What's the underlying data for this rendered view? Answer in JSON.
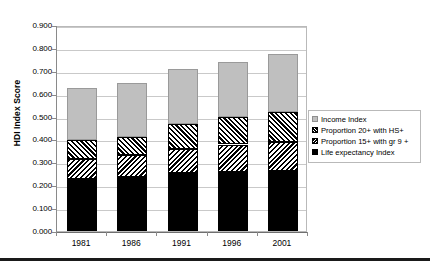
{
  "chart_data": {
    "type": "bar",
    "subtype": "stacked-bar",
    "title": "",
    "xlabel": "",
    "ylabel": "HDI Index Score",
    "ylim": [
      0.0,
      0.9
    ],
    "ytick_labels": [
      "0.900",
      "0.800",
      "0.700",
      "0.600",
      "0.500",
      "0.400",
      "0.300",
      "0.200",
      "0.100",
      "0.000"
    ],
    "ytick_values": [
      0.9,
      0.8,
      0.7,
      0.6,
      0.5,
      0.4,
      0.3,
      0.2,
      0.1,
      0.0
    ],
    "grid": true,
    "grid_axis": "y",
    "legend_position": "right",
    "categories": [
      "1981",
      "1986",
      "1991",
      "1996",
      "2001"
    ],
    "series": [
      {
        "name": "Life expectancy Index",
        "swatch": "solid-black",
        "color": "#000000",
        "values": [
          0.228,
          0.237,
          0.253,
          0.258,
          0.262
        ]
      },
      {
        "name": "Proportion 15+ with gr 9 +",
        "swatch": "diagonal-hatch-left",
        "color": "#000000",
        "values": [
          0.087,
          0.093,
          0.107,
          0.12,
          0.128
        ]
      },
      {
        "name": "Proportion 20+ with HS+",
        "swatch": "diagonal-hatch-right",
        "color": "#000000",
        "values": [
          0.083,
          0.082,
          0.106,
          0.122,
          0.13
        ]
      },
      {
        "name": "Income Index",
        "swatch": "solid-gray",
        "color": "#bfbfbf",
        "values": [
          0.229,
          0.233,
          0.241,
          0.24,
          0.254
        ]
      }
    ],
    "totals": [
      0.627,
      0.645,
      0.707,
      0.74,
      0.772
    ]
  },
  "legend": {
    "items": [
      {
        "label": "Income Index",
        "swatch": "income-swatch"
      },
      {
        "label": "Proportion 20+ with HS+",
        "swatch": "hs-swatch"
      },
      {
        "label": "Proportion 15+ with gr 9 +",
        "swatch": "gr9-swatch"
      },
      {
        "label": "Life expectancy Index",
        "swatch": "life-swatch"
      }
    ]
  }
}
